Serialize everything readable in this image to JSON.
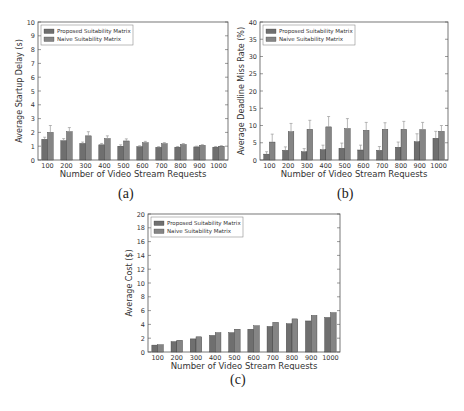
{
  "captions": [
    "(a)",
    "(b)",
    "(c)"
  ],
  "colors": {
    "proposed": "#6f6f6f",
    "naive": "#858585",
    "axis": "#555555",
    "error_bar": "#9a9a9a"
  },
  "chart_data": [
    {
      "type": "bar",
      "title": "",
      "xlabel": "Number of Video Stream Requests",
      "ylabel": "Average Startup Delay (s)",
      "categories": [
        "100",
        "200",
        "300",
        "400",
        "500",
        "600",
        "700",
        "800",
        "900",
        "1000"
      ],
      "ylim": [
        0,
        10
      ],
      "yticks": [
        0,
        1,
        2,
        3,
        4,
        5,
        6,
        7,
        8,
        9,
        10
      ],
      "grid": false,
      "legend_position": "upper left",
      "series": [
        {
          "name": "Proposed Suitability Matrix",
          "values": [
            1.5,
            1.4,
            1.2,
            1.1,
            1.0,
            0.97,
            0.92,
            0.93,
            0.95,
            0.93
          ],
          "errors": [
            0.15,
            0.15,
            0.1,
            0.1,
            0.1,
            0.06,
            0.05,
            0.05,
            0.05,
            0.05
          ]
        },
        {
          "name": "Naive Suitability Matrix",
          "values": [
            2.0,
            2.05,
            1.75,
            1.55,
            1.38,
            1.25,
            1.18,
            1.12,
            1.06,
            1.0
          ],
          "errors": [
            0.5,
            0.3,
            0.3,
            0.2,
            0.15,
            0.1,
            0.08,
            0.07,
            0.05,
            0.04
          ]
        }
      ]
    },
    {
      "type": "bar",
      "title": "",
      "xlabel": "Number of Video Stream Requests",
      "ylabel": "Average Deadline Miss Rate (%)",
      "categories": [
        "100",
        "200",
        "300",
        "400",
        "500",
        "600",
        "700",
        "800",
        "900",
        "1000"
      ],
      "ylim": [
        0,
        40
      ],
      "yticks": [
        0,
        5,
        10,
        15,
        20,
        25,
        30,
        35,
        40
      ],
      "grid": false,
      "legend_position": "upper left",
      "series": [
        {
          "name": "Proposed Suitability Matrix",
          "values": [
            1.7,
            2.8,
            2.4,
            3.0,
            3.4,
            2.9,
            2.8,
            3.7,
            5.3,
            6.3
          ],
          "errors": [
            0.7,
            1.0,
            0.9,
            1.3,
            1.5,
            1.4,
            1.1,
            1.5,
            2.3,
            2.0
          ]
        },
        {
          "name": "Naive Suitability Matrix",
          "values": [
            5.2,
            8.2,
            8.9,
            9.6,
            9.1,
            8.6,
            8.9,
            8.9,
            8.8,
            8.3
          ],
          "errors": [
            2.3,
            2.4,
            2.6,
            3.0,
            2.9,
            2.3,
            1.9,
            2.3,
            2.1,
            1.7
          ]
        }
      ]
    },
    {
      "type": "bar",
      "title": "",
      "xlabel": "Number of Video Stream Requests",
      "ylabel": "Average Cost ($)",
      "categories": [
        "100",
        "200",
        "300",
        "400",
        "500",
        "600",
        "700",
        "800",
        "900",
        "1000"
      ],
      "ylim": [
        0,
        20
      ],
      "yticks": [
        0,
        2,
        4,
        6,
        8,
        10,
        12,
        14,
        16,
        18,
        20
      ],
      "grid": false,
      "legend_position": "upper left",
      "series": [
        {
          "name": "Proposed Suitability Matrix",
          "values": [
            1.0,
            1.5,
            1.9,
            2.4,
            2.8,
            3.3,
            3.7,
            4.1,
            4.5,
            5.0
          ],
          "errors": [
            0,
            0,
            0,
            0,
            0,
            0,
            0,
            0,
            0,
            0
          ]
        },
        {
          "name": "Naive Suitability Matrix",
          "values": [
            1.05,
            1.7,
            2.2,
            2.8,
            3.3,
            3.8,
            4.3,
            4.8,
            5.3,
            5.7
          ],
          "errors": [
            0,
            0,
            0,
            0,
            0,
            0,
            0,
            0,
            0,
            0
          ]
        }
      ]
    }
  ]
}
